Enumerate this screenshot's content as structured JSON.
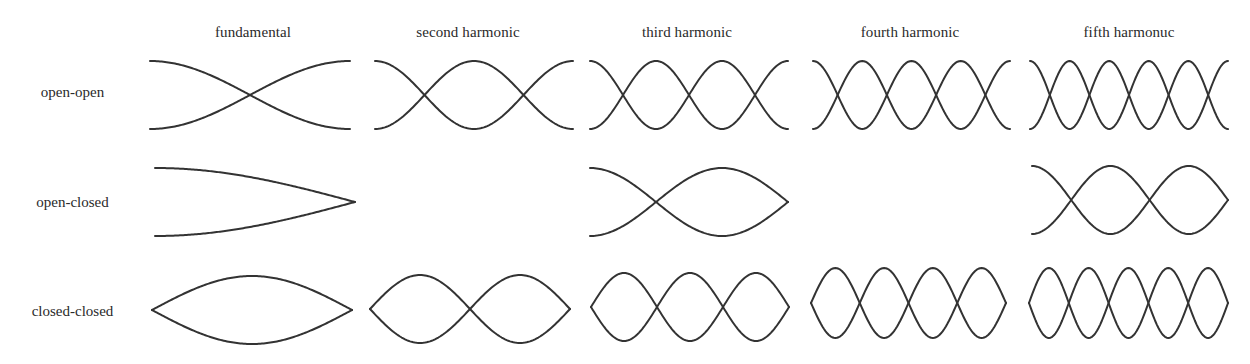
{
  "columns": [
    {
      "id": "h1",
      "label": "fundamental",
      "center_x": 253
    },
    {
      "id": "h2",
      "label": "second harmonic",
      "center_x": 468
    },
    {
      "id": "h3",
      "label": "third harmonic",
      "center_x": 687
    },
    {
      "id": "h4",
      "label": "fourth harmonic",
      "center_x": 910
    },
    {
      "id": "h5",
      "label": "fifth harmonuc",
      "center_x": 1129
    }
  ],
  "rows": [
    {
      "id": "open-open",
      "label": "open-open",
      "center_y": 92
    },
    {
      "id": "open-closed",
      "label": "open-closed",
      "center_y": 202
    },
    {
      "id": "closed-closed",
      "label": "closed-closed",
      "center_y": 311
    }
  ],
  "stroke_color": "#333333",
  "cells": [
    {
      "row": "open-open",
      "col": "h1",
      "x0": 150,
      "x1": 350,
      "cy": 95,
      "amp": 34,
      "left": "open",
      "right": "open",
      "half_waves": 1
    },
    {
      "row": "open-open",
      "col": "h2",
      "x0": 375,
      "x1": 573,
      "cy": 95,
      "amp": 34,
      "left": "open",
      "right": "open",
      "half_waves": 2
    },
    {
      "row": "open-open",
      "col": "h3",
      "x0": 590,
      "x1": 788,
      "cy": 95,
      "amp": 34,
      "left": "open",
      "right": "open",
      "half_waves": 3
    },
    {
      "row": "open-open",
      "col": "h4",
      "x0": 813,
      "x1": 1010,
      "cy": 95,
      "amp": 34,
      "left": "open",
      "right": "open",
      "half_waves": 4
    },
    {
      "row": "open-open",
      "col": "h5",
      "x0": 1030,
      "x1": 1228,
      "cy": 95,
      "amp": 34,
      "left": "open",
      "right": "open",
      "half_waves": 5
    },
    {
      "row": "open-closed",
      "col": "h1",
      "x0": 155,
      "x1": 355,
      "cy": 202,
      "amp": 34,
      "left": "open",
      "right": "closed",
      "quarter_waves": 1
    },
    {
      "row": "open-closed",
      "col": "h3",
      "x0": 590,
      "x1": 788,
      "cy": 202,
      "amp": 34,
      "left": "open",
      "right": "closed",
      "quarter_waves": 3
    },
    {
      "row": "open-closed",
      "col": "h5",
      "x0": 1032,
      "x1": 1228,
      "cy": 200,
      "amp": 34,
      "left": "open",
      "right": "closed",
      "quarter_waves": 5
    },
    {
      "row": "closed-closed",
      "col": "h1",
      "x0": 152,
      "x1": 352,
      "cy": 310,
      "amp": 34,
      "left": "closed",
      "right": "closed",
      "half_waves": 1
    },
    {
      "row": "closed-closed",
      "col": "h2",
      "x0": 370,
      "x1": 570,
      "cy": 309,
      "amp": 34,
      "left": "closed",
      "right": "closed",
      "half_waves": 2
    },
    {
      "row": "closed-closed",
      "col": "h3",
      "x0": 591,
      "x1": 789,
      "cy": 307,
      "amp": 34,
      "left": "closed",
      "right": "closed",
      "half_waves": 3
    },
    {
      "row": "closed-closed",
      "col": "h4",
      "x0": 811,
      "x1": 1006,
      "cy": 303,
      "amp": 35,
      "left": "closed",
      "right": "closed",
      "half_waves": 4
    },
    {
      "row": "closed-closed",
      "col": "h5",
      "x0": 1029,
      "x1": 1228,
      "cy": 303,
      "amp": 35,
      "left": "closed",
      "right": "closed",
      "half_waves": 5
    }
  ]
}
